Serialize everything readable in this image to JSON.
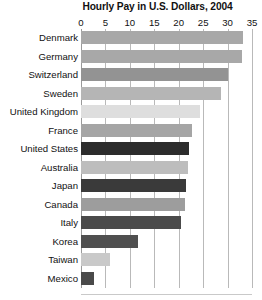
{
  "chart_data": {
    "type": "bar",
    "orientation": "horizontal",
    "title": "Hourly Pay in U.S. Dollars, 2004",
    "xlabel": "",
    "ylabel": "",
    "xlim": [
      0,
      35
    ],
    "xticks": [
      0,
      5,
      10,
      15,
      20,
      25,
      30,
      35
    ],
    "grid": true,
    "legend": "none",
    "categories": [
      "Denmark",
      "Germany",
      "Switzerland",
      "Sweden",
      "United Kingdom",
      "France",
      "United States",
      "Australia",
      "Japan",
      "Canada",
      "Italy",
      "Korea",
      "Taiwan",
      "Mexico"
    ],
    "values": [
      33.2,
      32.9,
      30.0,
      28.6,
      24.3,
      22.8,
      22.2,
      21.8,
      21.4,
      21.2,
      20.5,
      11.7,
      6.0,
      2.7
    ],
    "bar_colors": [
      "#a8a8a8",
      "#a8a8a8",
      "#939393",
      "#b5b5b5",
      "#dedede",
      "#a5a5a5",
      "#2c2c2c",
      "#bdbdbd",
      "#3a3a3a",
      "#9d9d9d",
      "#4a4a4a",
      "#4f4f4f",
      "#c9c9c9",
      "#4a4a4a"
    ]
  },
  "colors": {
    "background": "#ffffff",
    "text": "#111111",
    "gridline": "#b9b9b9"
  }
}
